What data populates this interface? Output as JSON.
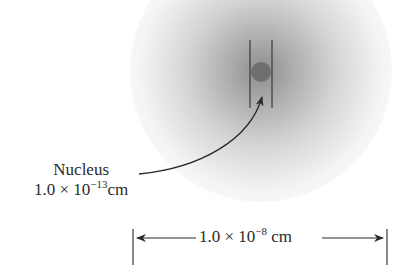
{
  "diagram": {
    "type": "atom-scale-illustration",
    "electron_cloud": {
      "shape": "circle",
      "shading": "radial gray gradient"
    },
    "nucleus": {
      "label": "Nucleus",
      "size_mantissa": "1.0 × 10",
      "size_exponent": "−13",
      "size_unit": "cm",
      "color": "#6e6e6e"
    },
    "atom_dimension": {
      "mantissa": "1.0 × 10",
      "exponent": "−8",
      "unit": " cm"
    },
    "line_color": "#333333"
  }
}
